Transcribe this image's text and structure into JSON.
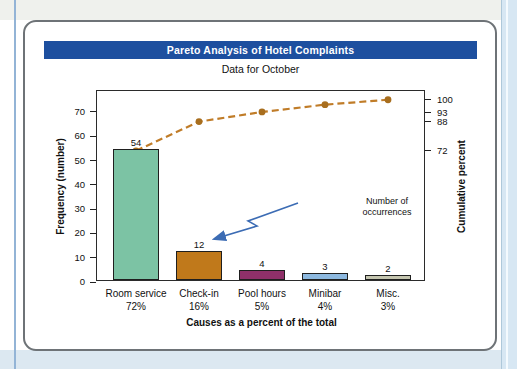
{
  "page": {
    "header": "Pareto Analysis of Hotel Complaints",
    "subtitle": "Data for October"
  },
  "chart_data": {
    "type": "bar",
    "variant": "pareto-with-cumulative-line",
    "title": "Pareto Analysis of Hotel Complaints",
    "subtitle": "Data for October",
    "categories": [
      "Room service",
      "Check-in",
      "Pool hours",
      "Minibar",
      "Misc."
    ],
    "category_percents": [
      "72%",
      "16%",
      "5%",
      "4%",
      "3%"
    ],
    "values": [
      54,
      12,
      4,
      3,
      2
    ],
    "cumulative_percent": [
      72,
      88,
      93.3,
      97.3,
      100
    ],
    "xlabel": "Causes as a percent of the total",
    "ylabel_left": "Frequency (number)",
    "ylabel_right": "Cumulative percent",
    "left_ticks": [
      0,
      10,
      20,
      30,
      40,
      50,
      60,
      70
    ],
    "right_ticks": [
      72,
      88,
      93,
      100
    ],
    "ylim_left": [
      0,
      78
    ],
    "grid": false,
    "legend": "none",
    "bar_colors": [
      "#7cc3a4",
      "#c0791b",
      "#8f3069",
      "#8db9e0",
      "#c5c6b0"
    ],
    "bar_border_color": "#1f1f1f",
    "line_color": "#c07c28",
    "marker_color": "#a86e1e",
    "title_bar_color": "#1d4f9f",
    "annotation": {
      "line1": "Number of",
      "line2": "occurrences",
      "arrow_color": "#3c6cb4"
    }
  }
}
